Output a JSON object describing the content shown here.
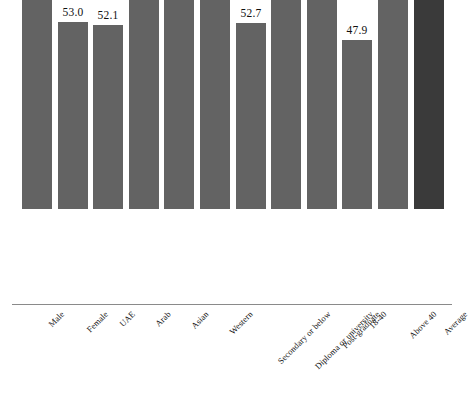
{
  "chart_data": {
    "type": "bar",
    "title": "",
    "subtitle": "",
    "xlabel": "",
    "ylabel": "",
    "ylim": [
      0,
      85
    ],
    "grid": false,
    "legend": "none",
    "categories": [
      "Male",
      "Female",
      "UAE",
      "Arab",
      "Asian",
      "Western",
      "Secondary or below",
      "Diploma or university",
      "Post-graduate",
      "18-40",
      "Above 40",
      "Average"
    ],
    "values": [
      67.7,
      53.0,
      52.1,
      66.2,
      63.8,
      75.6,
      52.7,
      62.8,
      63.8,
      47.9,
      69.7,
      61.2
    ],
    "data_labels": [
      "67.7",
      "53.0",
      "52.1",
      "66.2",
      "63.8",
      "75.6",
      "52.7",
      "62.8",
      "63.8",
      "47.9",
      "69.7",
      "61.2"
    ],
    "bar_colors": [
      "#636363",
      "#636363",
      "#636363",
      "#636363",
      "#636363",
      "#636363",
      "#636363",
      "#636363",
      "#636363",
      "#636363",
      "#636363",
      "#3a3a3a"
    ],
    "highlight_category": "Average",
    "highlight_color": "#3a3a3a",
    "series_color": "#636363",
    "background_color": "#ffffff",
    "axis_color": "#8a8a8a"
  }
}
